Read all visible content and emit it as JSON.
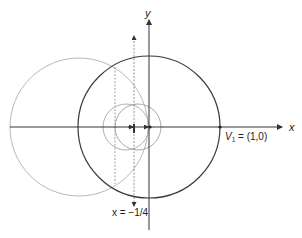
{
  "diagram": {
    "axes": {
      "x_label": "x",
      "y_label": "y"
    },
    "annotations": {
      "vertex_label_v": "V",
      "vertex_label_sub": "1",
      "vertex_label_rest": " = (1,0)",
      "directrix_label": "x = −1/4"
    },
    "colors": {
      "dark": "#3a3a3a",
      "light": "#b8b8b8",
      "axis": "#333333"
    },
    "elements": [
      {
        "type": "circle",
        "name": "unit-circle",
        "center": [
          0,
          0
        ],
        "radius": 1,
        "stroke": "dark"
      },
      {
        "type": "circle",
        "name": "large-reflected-circle",
        "center": [
          -1,
          0
        ],
        "radius": 1,
        "stroke": "light"
      },
      {
        "type": "circle",
        "name": "small-circle-left",
        "stroke": "light"
      },
      {
        "type": "circle",
        "name": "small-circle-right",
        "stroke": "light"
      },
      {
        "type": "line",
        "name": "directrix",
        "equation": "x = -1/4",
        "style": "dashed"
      },
      {
        "type": "line",
        "name": "vertical-dotted-line",
        "style": "dotted"
      },
      {
        "type": "point",
        "name": "vertex-V1",
        "coords": [
          1,
          0
        ]
      }
    ]
  }
}
